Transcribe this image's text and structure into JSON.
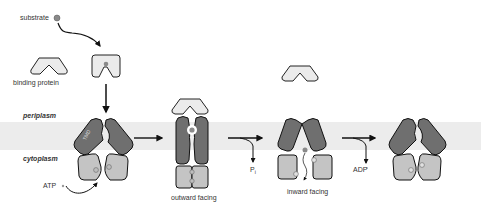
{
  "diagram": {
    "labels": {
      "substrate": "substrate",
      "binding_protein": "binding protein",
      "periplasm": "periplasm",
      "cytoplasm": "cytoplasm",
      "atp": "ATP",
      "tmd": "TMD",
      "nbd": "NBD",
      "pi": "P",
      "pi_sub": "i",
      "adp": "ADP",
      "outward_facing": "outward facing",
      "inward_facing": "inward facing"
    },
    "colors": {
      "membrane": "#ececec",
      "tmd": "#6f6f6f",
      "nbd": "#c4c4c4",
      "binding_protein": "#ebebeb",
      "substrate": "#8a8a8a",
      "outline": "#1a1a1a",
      "arrow": "#111111"
    },
    "states": [
      {
        "name": "resting",
        "label": ""
      },
      {
        "name": "outward-facing",
        "label": "outward facing"
      },
      {
        "name": "inward-facing",
        "label": "inward facing"
      },
      {
        "name": "reset",
        "label": ""
      }
    ]
  }
}
